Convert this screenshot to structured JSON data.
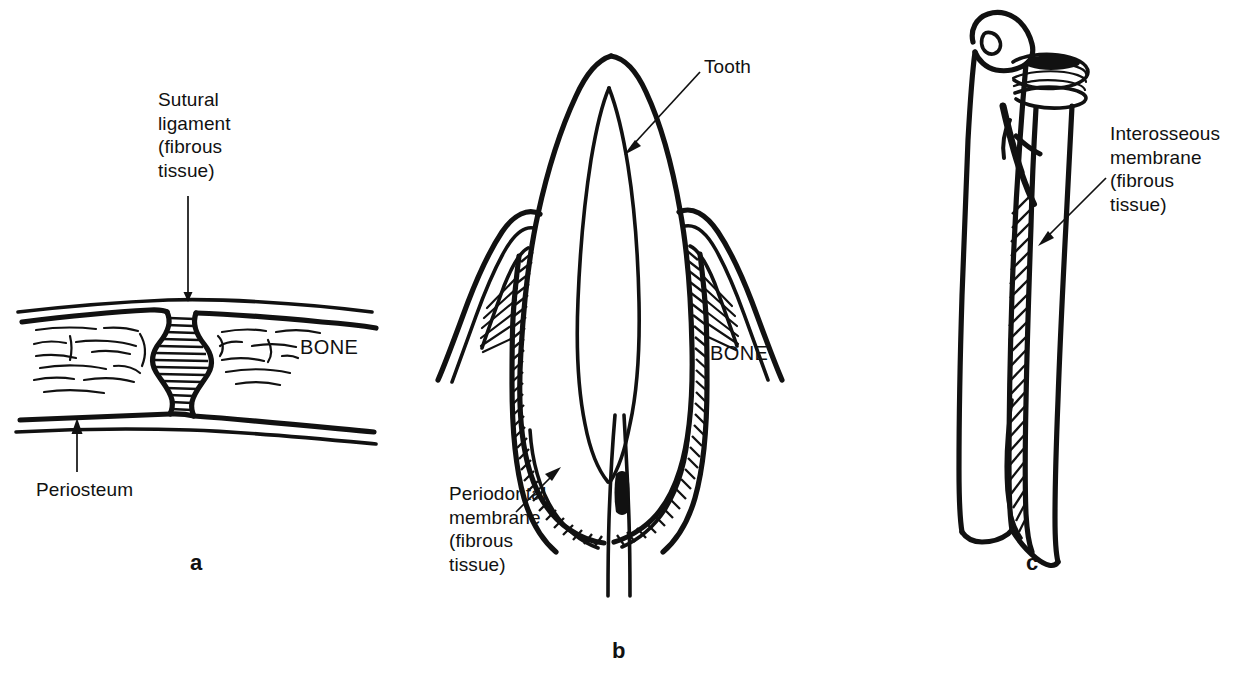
{
  "figure": {
    "type": "anatomical-line-diagram",
    "background_color": "#ffffff",
    "ink_color": "#111111",
    "panels": [
      {
        "letter": "a",
        "name": "suture",
        "labels": [
          {
            "name": "sutural-ligament",
            "text": "Sutural\nligament\n(fibrous\ntissue)",
            "style": "multiline",
            "leader": "vertical-line-down"
          },
          {
            "name": "bone",
            "text": "BONE",
            "style": "caps",
            "leader": "none"
          },
          {
            "name": "periosteum",
            "text": "Periosteum",
            "style": "plain",
            "leader": "arrow-up"
          }
        ]
      },
      {
        "letter": "b",
        "name": "gomphosis-tooth-socket",
        "labels": [
          {
            "name": "tooth",
            "text": "Tooth",
            "style": "plain",
            "leader": "arrow-down-left"
          },
          {
            "name": "bone",
            "text": "BONE",
            "style": "caps",
            "leader": "none"
          },
          {
            "name": "periodontal-membrane",
            "text": "Periodontal\nmembrane\n(fibrous\ntissue)",
            "style": "multiline",
            "leader": "arrow-up-right"
          }
        ]
      },
      {
        "letter": "c",
        "name": "syndesmosis-interosseous-membrane",
        "labels": [
          {
            "name": "interosseous-membrane",
            "text": "Interosseous\nmembrane\n(fibrous\ntissue)",
            "style": "multiline",
            "leader": "arrow-down-left"
          }
        ]
      }
    ]
  },
  "panel_a": {
    "letter": "a",
    "sutural_ligament_label": "Sutural\nligament\n(fibrous\ntissue)",
    "bone_label": "BONE",
    "periosteum_label": "Periosteum"
  },
  "panel_b": {
    "letter": "b",
    "tooth_label": "Tooth",
    "bone_label": "BONE",
    "periodontal_label": "Periodontal\nmembrane\n(fibrous\ntissue)"
  },
  "panel_c": {
    "letter": "c",
    "interosseous_label": "Interosseous\nmembrane\n(fibrous\ntissue)"
  }
}
